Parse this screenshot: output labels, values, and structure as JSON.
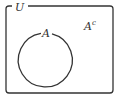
{
  "diagram": {
    "type": "venn",
    "universe": {
      "label": "U"
    },
    "sets": [
      {
        "label": "A"
      }
    ],
    "complement": {
      "label": "A",
      "superscript": "c"
    },
    "colors": {
      "stroke": "#333333",
      "background": "#ffffff"
    }
  }
}
